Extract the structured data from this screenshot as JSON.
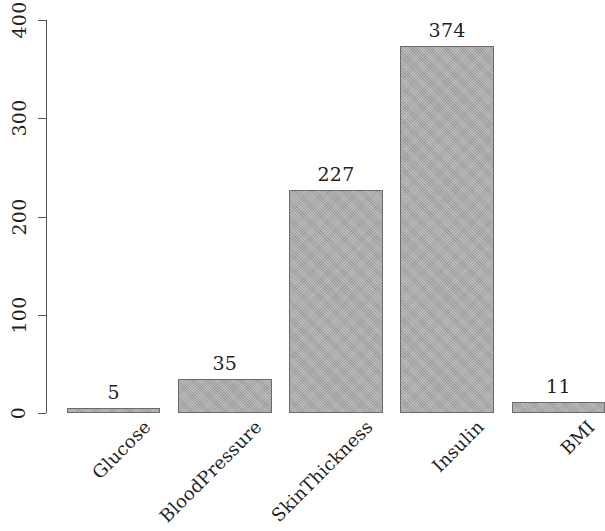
{
  "chart_data": {
    "type": "bar",
    "title": "",
    "subtitle": "",
    "xlabel": "",
    "ylabel": "",
    "categories": [
      "Glucose",
      "BloodPressure",
      "SkinThickness",
      "Insulin",
      "BMI"
    ],
    "values": [
      5,
      35,
      227,
      374,
      11
    ],
    "value_labels": [
      "5",
      "35",
      "227",
      "374",
      "11"
    ],
    "ylim": [
      0,
      400
    ],
    "yticks": [
      0,
      100,
      200,
      300,
      400
    ],
    "ytick_labels": [
      "0",
      "100",
      "200",
      "300",
      "400"
    ],
    "grid": false,
    "legend": null,
    "bar_color": "#a9a9a9",
    "bar_edge_color": "#6b6b6b",
    "axis_color": "#555555",
    "background": "#ffffff",
    "series": [
      {
        "name": "count",
        "values": [
          5,
          35,
          227,
          374,
          11
        ]
      }
    ]
  }
}
